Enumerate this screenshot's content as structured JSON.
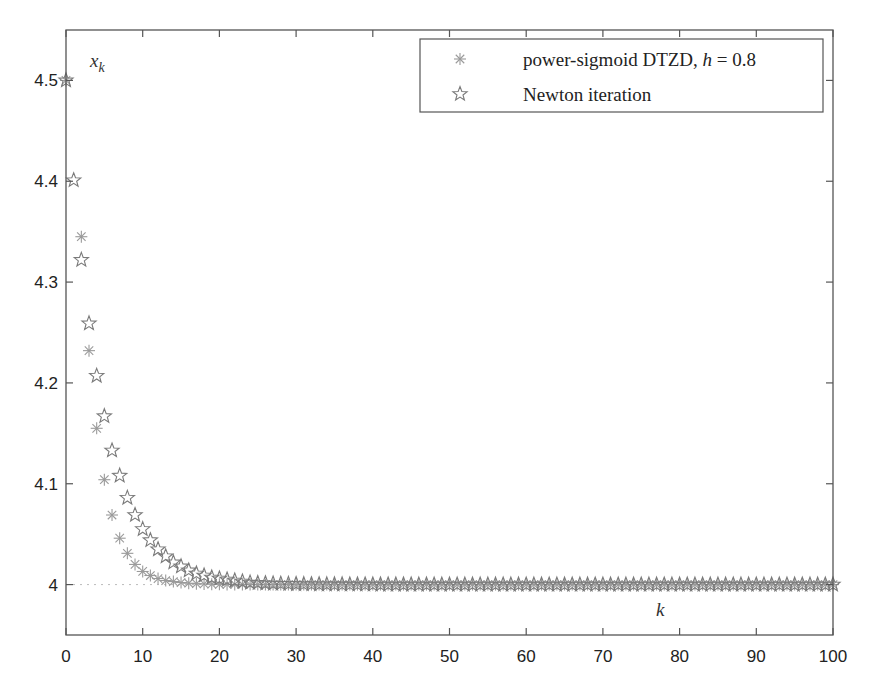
{
  "header": {
    "title_fragment": "...t  p...e  ...g..."
  },
  "chart_data": {
    "type": "scatter",
    "title": "",
    "xlabel": "k",
    "ylabel": "x_k",
    "xlim": [
      0,
      100
    ],
    "ylim": [
      3.95,
      4.55
    ],
    "xticks": [
      0,
      10,
      20,
      30,
      40,
      50,
      60,
      70,
      80,
      90,
      100
    ],
    "xtick_labels": [
      "0",
      "10",
      "20",
      "30",
      "40",
      "50",
      "60",
      "70",
      "80",
      "90",
      "100"
    ],
    "yticks": [
      4.0,
      4.1,
      4.2,
      4.3,
      4.4,
      4.5
    ],
    "ytick_labels": [
      "4",
      "4.1",
      "4.2",
      "4.3",
      "4.4",
      "4.5"
    ],
    "grid": false,
    "reference_line": {
      "y": 4.0,
      "style": "dotted"
    },
    "legend": {
      "position": "upper right",
      "entries": [
        "power-sigmoid DTZD, h = 0.8",
        "Newton iteration"
      ]
    },
    "series": [
      {
        "name": "power-sigmoid DTZD, h = 0.8",
        "marker": "asterisk",
        "color": "#9a9a9a",
        "x_start": 0,
        "decay_ratio": 0.67,
        "values_first": [
          4.5,
          4.5,
          4.345,
          4.232,
          4.155,
          4.104,
          4.069,
          4.046,
          4.031,
          4.02,
          4.013,
          4.009,
          4.006,
          4.004,
          4.003,
          4.002
        ],
        "steady_value": 4.0
      },
      {
        "name": "Newton iteration",
        "marker": "star",
        "color": "#7a7a7a",
        "x_start": 0,
        "decay_ratio": 0.8,
        "values_first": [
          4.5,
          4.401,
          4.322,
          4.259,
          4.207,
          4.167,
          4.133,
          4.108,
          4.086,
          4.069,
          4.055,
          4.044,
          4.035,
          4.028,
          4.022,
          4.018,
          4.014,
          4.011,
          4.009,
          4.007,
          4.006,
          4.005,
          4.004,
          4.003,
          4.002
        ],
        "steady_value": 4.0
      }
    ]
  },
  "plot": {
    "x_axis_label": "k",
    "y_axis_label_main": "x",
    "y_axis_label_sub": "k"
  },
  "legend": {
    "entries": [
      {
        "label_main": "power-sigmoid DTZD, ",
        "label_var": "h",
        "label_rest": " = 0.8",
        "marker": "asterisk-icon"
      },
      {
        "label_main": "Newton iteration",
        "label_var": "",
        "label_rest": "",
        "marker": "star-icon"
      }
    ]
  }
}
